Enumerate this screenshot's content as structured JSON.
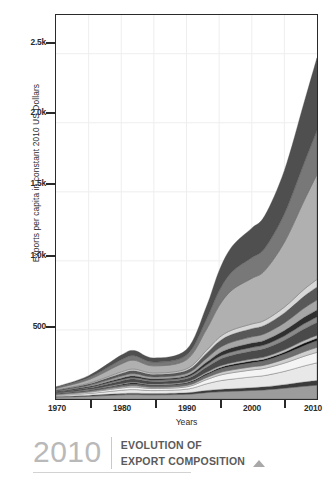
{
  "chart_data": {
    "type": "area",
    "title": "EVOLUTION OF EXPORT COMPOSITION",
    "xlabel": "Years",
    "ylabel": "Exports per capita in constant 2010 US Dollars",
    "xlim": [
      1970,
      2010
    ],
    "ylim": [
      0,
      2780
    ],
    "grid": true,
    "legend_position": "none",
    "stacked": true,
    "x": [
      1970,
      1975,
      1980,
      1982,
      1985,
      1990,
      1993,
      1995,
      1997,
      2000,
      2002,
      2005,
      2008,
      2010
    ],
    "xticks": [
      1970,
      1980,
      1990,
      2000,
      2010
    ],
    "xtick_labels": [
      "1970",
      "1980",
      "1990",
      "2000",
      "2010"
    ],
    "xminor_ticks": [
      1975,
      1985,
      1995,
      2005
    ],
    "yticks": [
      500,
      1000,
      1500,
      2000,
      2500
    ],
    "ytick_labels": [
      "500",
      "1.0k",
      "1.5k",
      "2.0k",
      "2.5k"
    ],
    "series": [
      {
        "name": "band-01-agriculture",
        "color": "#9c9c9c",
        "values": [
          14,
          20,
          30,
          32,
          30,
          34,
          46,
          52,
          56,
          62,
          66,
          78,
          92,
          100
        ]
      },
      {
        "name": "band-02-foodstuffs",
        "color": "#3a3a3a",
        "values": [
          4,
          6,
          9,
          10,
          9,
          11,
          15,
          17,
          18,
          20,
          22,
          26,
          31,
          34
        ]
      },
      {
        "name": "band-03-minerals",
        "color": "#e8e8e8",
        "values": [
          8,
          14,
          24,
          26,
          22,
          26,
          48,
          62,
          70,
          78,
          82,
          96,
          116,
          128
        ]
      },
      {
        "name": "band-04-fuels",
        "color": "#f4f4f4",
        "values": [
          5,
          9,
          16,
          18,
          15,
          17,
          30,
          40,
          46,
          50,
          52,
          60,
          70,
          76
        ]
      },
      {
        "name": "band-05-chemicals",
        "color": "#cfcfcf",
        "values": [
          3,
          5,
          9,
          10,
          9,
          10,
          15,
          19,
          21,
          23,
          24,
          28,
          33,
          36
        ]
      },
      {
        "name": "band-06-plastics",
        "color": "#6e6e6e",
        "values": [
          4,
          7,
          12,
          13,
          12,
          14,
          20,
          25,
          28,
          30,
          32,
          37,
          44,
          48
        ]
      },
      {
        "name": "band-07-hides-skins",
        "color": "#121212",
        "values": [
          2,
          3,
          5,
          6,
          5,
          6,
          8,
          10,
          11,
          12,
          12,
          14,
          17,
          18
        ]
      },
      {
        "name": "band-08-wood",
        "color": "#bdbdbd",
        "values": [
          2,
          4,
          6,
          7,
          6,
          7,
          10,
          12,
          13,
          14,
          15,
          17,
          20,
          22
        ]
      },
      {
        "name": "band-09-textiles",
        "color": "#4a4a4a",
        "values": [
          6,
          11,
          20,
          22,
          19,
          22,
          36,
          48,
          54,
          58,
          60,
          70,
          84,
          92
        ]
      },
      {
        "name": "band-10-footwear",
        "color": "#8a8a8a",
        "values": [
          3,
          5,
          9,
          10,
          9,
          10,
          16,
          21,
          24,
          26,
          27,
          31,
          37,
          40
        ]
      },
      {
        "name": "band-11-stone-glass",
        "color": "#2f2f2f",
        "values": [
          3,
          6,
          11,
          12,
          10,
          12,
          20,
          26,
          30,
          32,
          34,
          39,
          47,
          51
        ]
      },
      {
        "name": "band-12-metals",
        "color": "#a6a6a6",
        "values": [
          4,
          8,
          15,
          17,
          14,
          16,
          28,
          37,
          42,
          45,
          47,
          55,
          66,
          72
        ]
      },
      {
        "name": "band-13-machinery",
        "color": "#585858",
        "values": [
          5,
          10,
          19,
          21,
          18,
          21,
          36,
          48,
          55,
          59,
          61,
          72,
          86,
          94
        ]
      },
      {
        "name": "band-14-transportation",
        "color": "#d8d8d8",
        "values": [
          3,
          6,
          11,
          12,
          10,
          12,
          21,
          28,
          32,
          34,
          36,
          42,
          50,
          55
        ]
      },
      {
        "name": "band-15-electronics",
        "color": "#b0b0b0",
        "values": [
          10,
          26,
          58,
          64,
          52,
          66,
          150,
          230,
          290,
          330,
          360,
          470,
          640,
          760
        ]
      },
      {
        "name": "band-16-misc-manufacturing",
        "color": "#787878",
        "values": [
          6,
          14,
          30,
          33,
          27,
          34,
          72,
          108,
          132,
          150,
          162,
          206,
          272,
          318
        ]
      },
      {
        "name": "band-17-precious-metals",
        "color": "#4f4f4f",
        "values": [
          6,
          15,
          34,
          38,
          30,
          40,
          92,
          146,
          184,
          214,
          236,
          314,
          438,
          526
        ]
      }
    ],
    "totals_note": "stacked total reaches about 2780 at 2010"
  },
  "axis": {
    "ylabel": "Exports per capita in constant 2010 US Dollars",
    "xlabel": "Years",
    "yticks": [
      {
        "label": "2.5k",
        "top": 42
      },
      {
        "label": "2.0k",
        "top": 112
      },
      {
        "label": "1.5k",
        "top": 183
      },
      {
        "label": "1.0k",
        "top": 255
      },
      {
        "label": "500",
        "top": 326
      }
    ],
    "xticks": [
      {
        "label": "1970",
        "left": 57
      },
      {
        "label": "1980",
        "left": 122
      },
      {
        "label": "1990",
        "left": 187
      },
      {
        "label": "2000",
        "left": 252
      },
      {
        "label": "2010",
        "left": 315
      }
    ],
    "xminor": [
      90,
      155,
      220,
      284
    ]
  },
  "footer": {
    "year": "2010",
    "title_line1": "EVOLUTION OF",
    "title_line2": "EXPORT COMPOSITION"
  }
}
